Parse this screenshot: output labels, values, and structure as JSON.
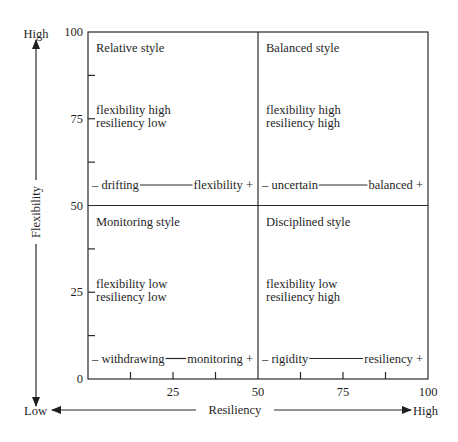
{
  "chart_data": {
    "type": "quadrant",
    "title": "",
    "xlabel": "Resiliency",
    "ylabel": "Flexibility",
    "x_axis": {
      "low_label": "Low",
      "high_label": "High",
      "range": [
        0,
        100
      ],
      "tick_labels": [
        "25",
        "50",
        "75",
        "100"
      ],
      "tick_values": [
        25,
        50,
        75,
        100
      ],
      "minor_step": 12.5
    },
    "y_axis": {
      "low_label": "Low",
      "high_label": "High",
      "range": [
        0,
        100
      ],
      "tick_labels": [
        "0",
        "25",
        "50",
        "75",
        "100"
      ],
      "tick_values": [
        0,
        25,
        50,
        75,
        100
      ],
      "minor_step": 12.5
    },
    "divider": {
      "x": 50,
      "y": 50
    },
    "quadrants": [
      {
        "id": "relative",
        "position": "top-left",
        "title": "Relative style",
        "desc": [
          "flexibility high",
          "resiliency low"
        ],
        "scale_left": "– drifting",
        "scale_right": "flexibility +"
      },
      {
        "id": "balanced",
        "position": "top-right",
        "title": "Balanced style",
        "desc": [
          "flexibility high",
          "resiliency high"
        ],
        "scale_left": "– uncertain",
        "scale_right": "balanced +"
      },
      {
        "id": "monitoring",
        "position": "bottom-left",
        "title": "Monitoring style",
        "desc": [
          "flexibility low",
          "resiliency low"
        ],
        "scale_left": "– withdrawing",
        "scale_right": "monitoring +"
      },
      {
        "id": "disciplined",
        "position": "bottom-right",
        "title": "Disciplined style",
        "desc": [
          "flexibility low",
          "resiliency high"
        ],
        "scale_left": "– rigidity",
        "scale_right": "resiliency +"
      }
    ]
  }
}
